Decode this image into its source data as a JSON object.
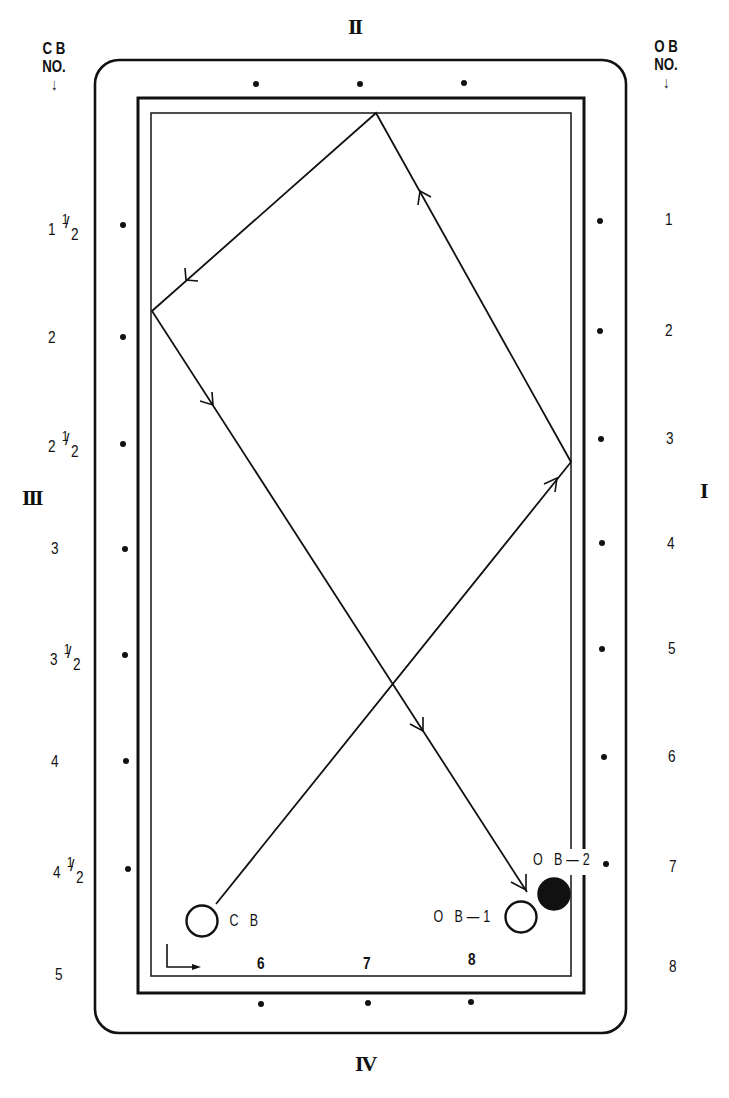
{
  "diagram": {
    "type": "billiards-table-diagram",
    "rail_labels": {
      "top": "II",
      "right": "I",
      "left": "III",
      "bottom": "IV"
    },
    "left_header": {
      "line1": "C B",
      "line2": "NO.",
      "arrow": "↓"
    },
    "right_header": {
      "line1": "O B",
      "line2": "NO.",
      "arrow": "↓"
    },
    "cb_numbers": [
      {
        "whole": "1",
        "frac": true
      },
      {
        "whole": "2",
        "frac": false
      },
      {
        "whole": "2",
        "frac": true
      },
      {
        "whole": "3",
        "frac": false
      },
      {
        "whole": "3",
        "frac": true
      },
      {
        "whole": "4",
        "frac": false
      },
      {
        "whole": "4",
        "frac": true
      },
      {
        "whole": "5",
        "frac": false
      }
    ],
    "fraction": {
      "numerator": "1",
      "slash": "/",
      "denominator": "2"
    },
    "ob_numbers": [
      "1",
      "2",
      "3",
      "4",
      "5",
      "6",
      "7",
      "8"
    ],
    "bottom_numbers": [
      "6",
      "7",
      "8"
    ],
    "balls": {
      "cue_ball": {
        "label": "C B",
        "fill": "#ffffff"
      },
      "object_ball_1": {
        "label": "O B—1",
        "fill": "#ffffff"
      },
      "object_ball_2": {
        "label": "O B—2",
        "fill": "#111111"
      }
    },
    "colors": {
      "ink": "#111111",
      "paper": "#ffffff"
    },
    "path_points": [
      [
        216,
        904
      ],
      [
        571,
        462
      ],
      [
        376,
        113
      ],
      [
        152,
        311
      ],
      [
        527,
        892
      ]
    ]
  }
}
